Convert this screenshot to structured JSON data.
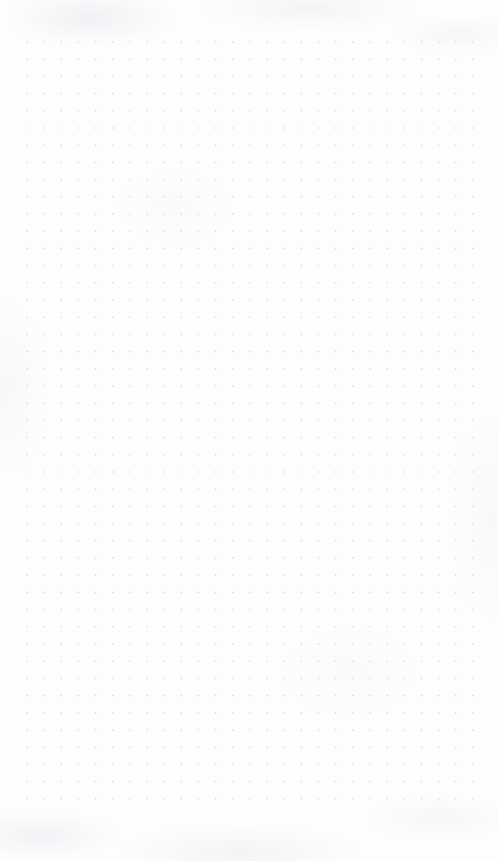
{
  "page": {
    "kind": "dot-grid-sheet",
    "title": "",
    "width_px": 498,
    "height_px": 861,
    "background_color": "#fdfdfe",
    "has_text": false,
    "has_ui_chrome": false
  },
  "grid": {
    "dot_color": "#d3d3d8",
    "dot_diameter_px": 1.5,
    "spacing_x_px": 17.15,
    "spacing_y_px": 17.2,
    "origin_x_px": 27,
    "origin_y_px": 42,
    "columns": 27,
    "rows": 45,
    "last_dot_x_px": 472,
    "last_dot_y_px": 799
  },
  "margins": {
    "left_px": 27,
    "top_px": 42,
    "right_px": 26,
    "bottom_px": 62
  },
  "texture": {
    "style": "subtle-mottled-paper",
    "tint_color": "#ececf1",
    "opacity": 0.5
  }
}
